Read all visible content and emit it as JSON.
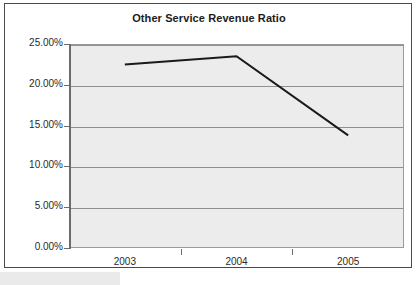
{
  "chart_data": {
    "type": "line",
    "title": "Other Service Revenue Ratio",
    "xlabel": "",
    "ylabel": "",
    "categories": [
      "2003",
      "2004",
      "2005"
    ],
    "series": [
      {
        "name": "Other Service Revenue Ratio",
        "values": [
          22.5,
          23.5,
          13.8
        ],
        "color": "#1a1a1a"
      }
    ],
    "ylim": [
      0,
      25
    ],
    "ytick_values": [
      0,
      5,
      10,
      15,
      20,
      25
    ],
    "ytick_labels": [
      "0.00%",
      "5.00%",
      "10.00%",
      "15.00%",
      "20.00%",
      "25.00%"
    ],
    "value_suffix": "%",
    "grid": true,
    "grid_axis": "y",
    "legend": false,
    "legend_position": "none",
    "markers": false,
    "plot_background": "#ececec",
    "gridline_color": "#8f8f8f",
    "axis_color": "#6b6b6b",
    "frame_color": "#4a4a4a",
    "page_background": "#ffffff"
  }
}
